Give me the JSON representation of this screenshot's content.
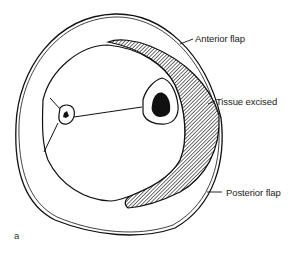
{
  "figure": {
    "panel_label": "a",
    "labels": {
      "anterior_flap": "Anterior flap",
      "tissue_excised": "Tissue excised",
      "posterior_flap": "Posterior flap"
    }
  },
  "colors": {
    "line": "#111111",
    "hatch": "#222222",
    "background": "#ffffff"
  }
}
